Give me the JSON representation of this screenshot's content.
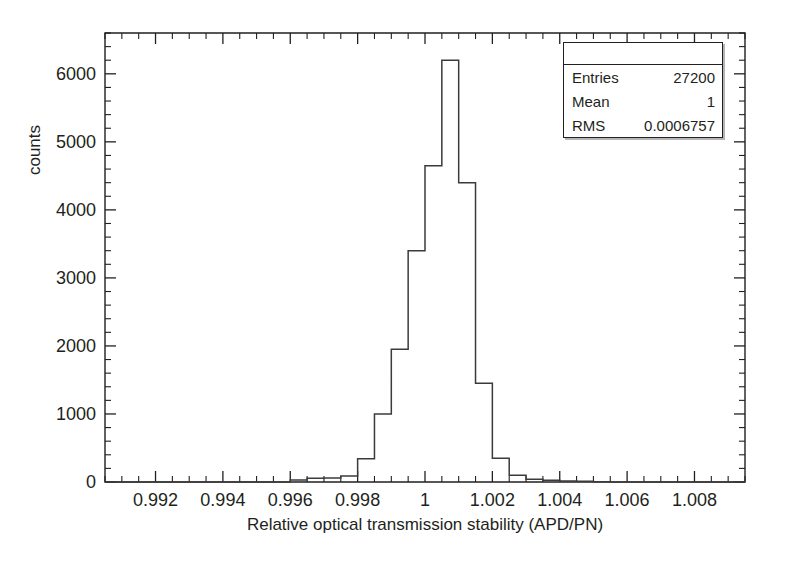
{
  "chart_data": {
    "type": "bar",
    "title": "",
    "xlabel": "Relative optical transmission stability (APD/PN)",
    "ylabel": "counts",
    "xlim": [
      0.9905,
      1.0095
    ],
    "ylim": [
      0,
      6600
    ],
    "grid": false,
    "legend": null,
    "bin_width": 0.0005,
    "x_ticks": [
      "0.992",
      "0.994",
      "0.996",
      "0.998",
      "1",
      "1.002",
      "1.004",
      "1.006",
      "1.008"
    ],
    "x_tick_values": [
      0.992,
      0.994,
      0.996,
      0.998,
      1.0,
      1.002,
      1.004,
      1.006,
      1.008
    ],
    "y_ticks": [
      "0",
      "1000",
      "2000",
      "3000",
      "4000",
      "5000",
      "6000"
    ],
    "y_tick_values": [
      0,
      1000,
      2000,
      3000,
      4000,
      5000,
      6000
    ],
    "bin_edges": [
      0.9905,
      0.991,
      0.9915,
      0.992,
      0.9925,
      0.993,
      0.9935,
      0.994,
      0.9945,
      0.995,
      0.9955,
      0.996,
      0.9965,
      0.997,
      0.9975,
      0.998,
      0.9985,
      0.999,
      0.9995,
      1.0,
      1.0005,
      1.001,
      1.0015,
      1.002,
      1.0025,
      1.003,
      1.0035,
      1.004,
      1.0045,
      1.005,
      1.0055,
      1.006,
      1.0065,
      1.007,
      1.0075,
      1.008,
      1.0085,
      1.009,
      1.0095
    ],
    "values": [
      0,
      0,
      0,
      0,
      0,
      0,
      0,
      0,
      0,
      0,
      0,
      30,
      55,
      60,
      90,
      340,
      1000,
      1950,
      3400,
      4650,
      6200,
      4400,
      1450,
      350,
      100,
      40,
      25,
      15,
      10,
      5,
      0,
      0,
      0,
      0,
      0,
      0,
      0,
      0
    ]
  },
  "stats_box": {
    "title": "",
    "rows": [
      {
        "key": "Entries",
        "value": "27200"
      },
      {
        "key": "Mean",
        "value": "1"
      },
      {
        "key": "RMS",
        "value": "0.0006757"
      }
    ]
  },
  "style": {
    "line_color": "#3c3b3c",
    "axis_color": "#231f20",
    "background": "#ffffff"
  }
}
